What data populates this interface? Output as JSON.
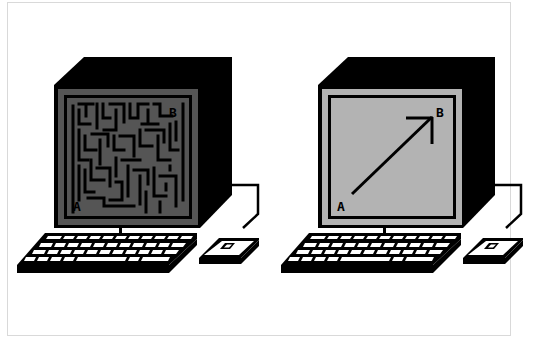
{
  "illustration": {
    "colors": {
      "background": "#ffffff",
      "frame_border": "#d9d9d9",
      "ink": "#000000",
      "maze_screen": "#555555",
      "direct_screen": "#b3b3b3",
      "keys": "#ffffff"
    },
    "left_computer": {
      "screen_content": "maze",
      "start_label": "A",
      "end_label": "B"
    },
    "right_computer": {
      "screen_content": "direct-arrow",
      "start_label": "A",
      "end_label": "B"
    }
  }
}
